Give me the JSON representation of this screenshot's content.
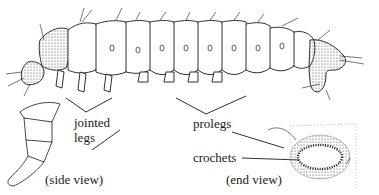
{
  "figure": {
    "labels": {
      "jointed_legs_line1": "jointed",
      "jointed_legs_line2": "legs",
      "prolegs": "prolegs",
      "crochets": "crochets",
      "side_view": "(side view)",
      "end_view": "(end view)"
    },
    "colors": {
      "ink": "#1a1a1a",
      "background": "#ffffff",
      "stipple": "#555555"
    }
  }
}
